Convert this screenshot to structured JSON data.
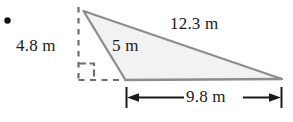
{
  "figure": {
    "kind": "geometry-diagram",
    "shape": "right-triangle",
    "bullet": "•",
    "labels": {
      "height": "4.8 m",
      "slant": "5 m",
      "hypotenuse": "12.3 m",
      "base": "9.8 m"
    },
    "colors": {
      "fill": "#f2f2f2",
      "stroke": "#8d8d8d",
      "dashed": "#6e6e6e",
      "dimension": "#1a1a1a",
      "text": "#1a1a1a",
      "background": "#ffffff"
    },
    "measurements": {
      "height_m": 4.8,
      "slant_m": 5,
      "hypotenuse_m": 12.3,
      "base_m": 9.8
    },
    "annotations": {
      "right_angle_marker": "right-angle",
      "dimension_line": "base-dimension-line"
    }
  }
}
